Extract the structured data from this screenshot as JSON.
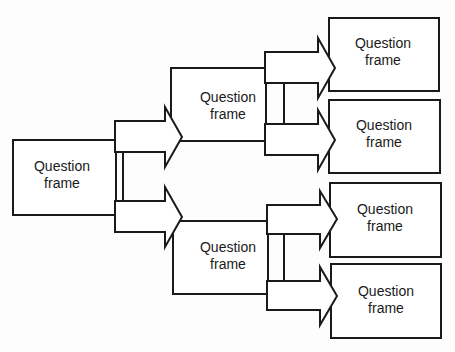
{
  "diagram": {
    "type": "tree",
    "nodes": [
      {
        "id": "root",
        "line1": "Question",
        "line2": "frame"
      },
      {
        "id": "mid_top",
        "line1": "Question",
        "line2": "frame"
      },
      {
        "id": "mid_bottom",
        "line1": "Question",
        "line2": "frame"
      },
      {
        "id": "leaf_1",
        "line1": "Question",
        "line2": "frame"
      },
      {
        "id": "leaf_2",
        "line1": "Question",
        "line2": "frame"
      },
      {
        "id": "leaf_3",
        "line1": "Question",
        "line2": "frame"
      },
      {
        "id": "leaf_4",
        "line1": "Question",
        "line2": "frame"
      }
    ],
    "edges": [
      {
        "from": "root",
        "to": "mid_top"
      },
      {
        "from": "root",
        "to": "mid_bottom"
      },
      {
        "from": "mid_top",
        "to": "leaf_1"
      },
      {
        "from": "mid_top",
        "to": "leaf_2"
      },
      {
        "from": "mid_bottom",
        "to": "leaf_3"
      },
      {
        "from": "mid_bottom",
        "to": "leaf_4"
      }
    ],
    "stroke_color": "#1a1a1a"
  }
}
